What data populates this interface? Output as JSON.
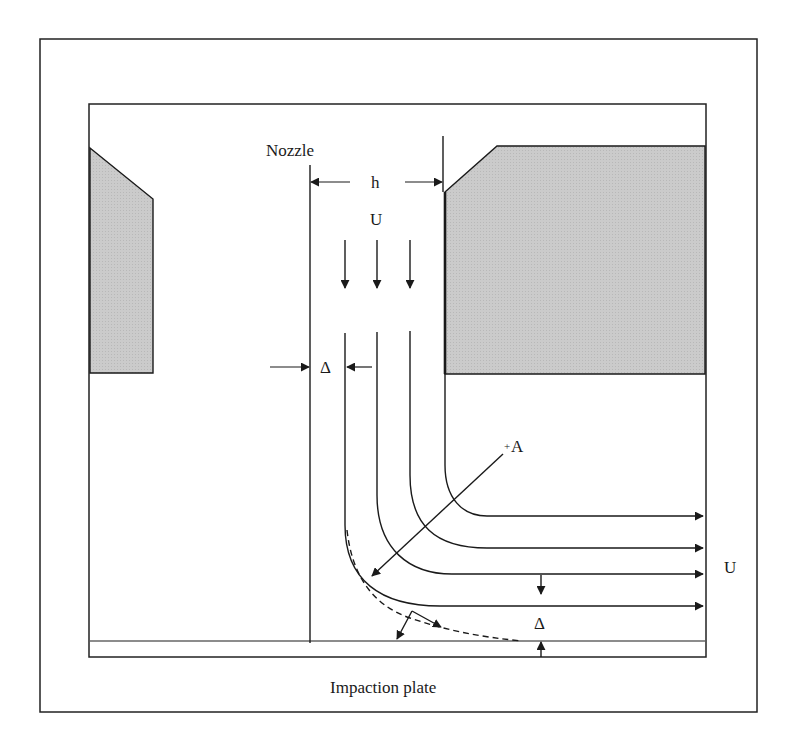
{
  "diagram": {
    "type": "schematic",
    "colors": {
      "line": "#1a1a1a",
      "shaded_body": "#c8c8c8",
      "background": "#ffffff"
    },
    "labels": {
      "nozzle": "Nozzle",
      "nozzle_width": "h",
      "inlet_velocity": "U",
      "inlet_boundary_thickness": "Δ",
      "section": "A",
      "section_marker": "+",
      "outlet_velocity": "U",
      "outlet_boundary_thickness": "Δ",
      "plate": "Impaction plate"
    },
    "elements": {
      "shaded_blocks": [
        "left-nozzle-body",
        "right-nozzle-body"
      ],
      "inlet_arrows": 3,
      "streamlines": 4,
      "outlet_arrows": 4,
      "dashed_boundary_layer": true
    }
  }
}
